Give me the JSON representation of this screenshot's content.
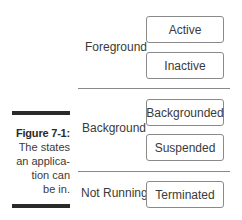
{
  "figure": {
    "label": "Figure 7-1:",
    "caption_lines": [
      "The states",
      "an applica-",
      "tion can",
      "be in."
    ]
  },
  "groups": [
    {
      "label": "Foreground",
      "states": [
        "Active",
        "Inactive"
      ]
    },
    {
      "label": "Background",
      "states": [
        "Backgrounded",
        "Suspended"
      ]
    },
    {
      "label": "Not Running",
      "states": [
        "Terminated"
      ]
    }
  ],
  "colors": {
    "text": "#3a3a3a",
    "box_border": "#8a8a8a",
    "bar": "#2a2a2a",
    "background": "#ffffff"
  }
}
